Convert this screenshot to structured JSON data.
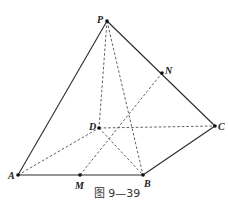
{
  "figure": {
    "caption": "图 9—39",
    "points": {
      "P": {
        "label": "P",
        "x": 107,
        "y": 21
      },
      "N": {
        "label": "N",
        "x": 162,
        "y": 73
      },
      "C": {
        "label": "C",
        "x": 215,
        "y": 126
      },
      "D": {
        "label": "D",
        "x": 99,
        "y": 128
      },
      "A": {
        "label": "A",
        "x": 18,
        "y": 175
      },
      "M": {
        "label": "M",
        "x": 80,
        "y": 175
      },
      "B": {
        "label": "B",
        "x": 143,
        "y": 175
      }
    },
    "solid_edges": [
      [
        "P",
        "A"
      ],
      [
        "P",
        "N"
      ],
      [
        "N",
        "C"
      ],
      [
        "A",
        "M"
      ],
      [
        "M",
        "B"
      ],
      [
        "B",
        "C"
      ]
    ],
    "dashed_edges": [
      [
        "P",
        "D"
      ],
      [
        "P",
        "B"
      ],
      [
        "A",
        "D"
      ],
      [
        "D",
        "C"
      ],
      [
        "D",
        "B"
      ],
      [
        "M",
        "N"
      ]
    ]
  }
}
